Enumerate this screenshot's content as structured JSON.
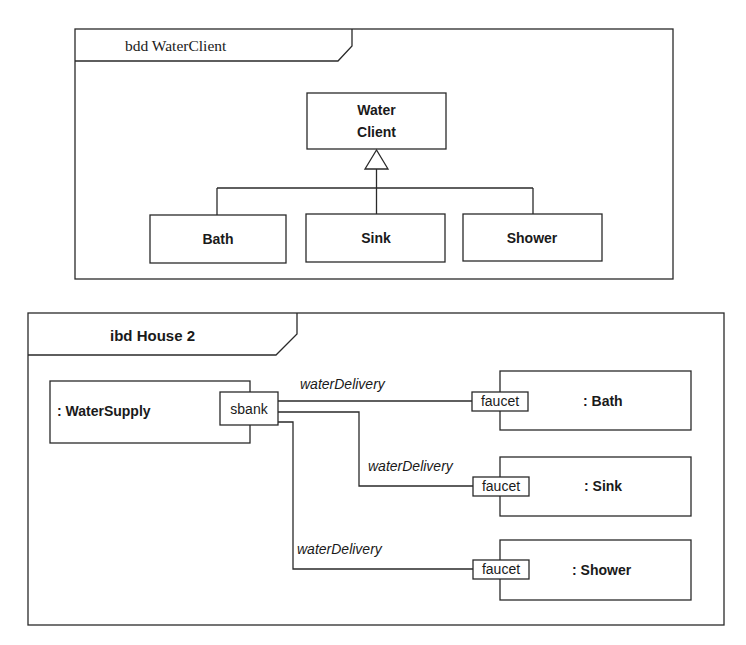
{
  "bdd": {
    "title": "bdd WaterClient",
    "parent_block": {
      "line1": "Water",
      "line2": "Client"
    },
    "children": [
      {
        "label": "Bath"
      },
      {
        "label": "Sink"
      },
      {
        "label": "Shower"
      }
    ],
    "relationship": "generalization"
  },
  "ibd": {
    "title": "ibd House 2",
    "source_part": {
      "label": ": WaterSupply",
      "port": "sbank"
    },
    "target_parts": [
      {
        "label": ": Bath",
        "port": "faucet",
        "connector": "waterDelivery"
      },
      {
        "label": ": Sink",
        "port": "faucet",
        "connector": "waterDelivery"
      },
      {
        "label": ": Shower",
        "port": "faucet",
        "connector": "waterDelivery"
      }
    ]
  },
  "colors": {
    "line": "#2a2a2a",
    "text": "#1a1a1a",
    "background": "#ffffff"
  }
}
